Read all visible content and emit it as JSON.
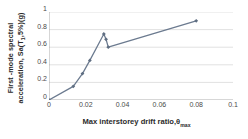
{
  "chart_data": {
    "type": "line",
    "title": "",
    "xlabel": "Max interstorey drift ratio,θmax",
    "xlabel_main": "Max interstorey drift ratio,θ",
    "xlabel_sub": "max",
    "ylabel": "First -mode spectral acceleration, Sa(T1,5%)(g)",
    "ylabel_line1": "First -mode spectral",
    "ylabel_line2_main": "acceleration, Sa(T",
    "ylabel_line2_sub": "1",
    "ylabel_line2_rest": ",5%)(g)",
    "xlim": [
      0,
      0.1
    ],
    "ylim": [
      0,
      1
    ],
    "xticks": [
      0,
      0.02,
      0.04,
      0.06,
      0.08,
      0.1
    ],
    "xticklabels": [
      "0",
      "0.02",
      "0.04",
      "0.06",
      "0.08",
      "0.1"
    ],
    "yticks": [
      0,
      0.2,
      0.4,
      0.6,
      0.8,
      1
    ],
    "yticklabels": [
      "0",
      "0.2",
      "0.4",
      "0.6",
      "0.8",
      "1"
    ],
    "grid": "horizontal",
    "legend": "none",
    "series": [
      {
        "name": "Pushover capacity curve",
        "color": "#6b7a8f",
        "marker": "diamond",
        "x": [
          0.0,
          0.0132,
          0.0182,
          0.0222,
          0.0298,
          0.031,
          0.0322,
          0.08
        ],
        "y": [
          0.0,
          0.155,
          0.3,
          0.45,
          0.75,
          0.69,
          0.6,
          0.9
        ]
      }
    ],
    "colors": {
      "line": "#6b7a8f",
      "marker": "#5f6e82",
      "grid": "#d4d4d4",
      "axis": "#9a9a9a",
      "tick_text": "#4a4a4a",
      "title_text": "#2b2b2b",
      "background": "#ffffff"
    }
  }
}
